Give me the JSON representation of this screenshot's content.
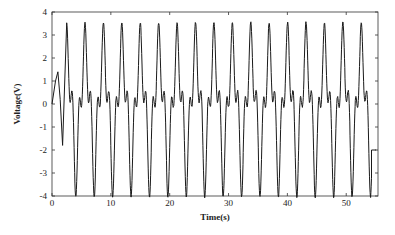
{
  "chart_data": {
    "type": "line",
    "title": "",
    "xlabel": "Time(s)",
    "ylabel": "Voltage(V)",
    "xlim": [
      0,
      55.4
    ],
    "ylim": [
      -4,
      4
    ],
    "xticks": [
      0,
      10,
      20,
      30,
      40,
      50
    ],
    "yticks": [
      -4,
      -3,
      -2,
      -1,
      0,
      1,
      2,
      3,
      4
    ],
    "grid": false,
    "legend": null,
    "series": [
      {
        "name": "Voltage",
        "color": "#1a1a1a",
        "description": "Periodic oscillation with main period ~3.13 s; main peaks ~+3.5 V, main troughs ~-3.7 V, secondary peaks ~+1.7 V, secondary troughs ~-1.8 V; 17 main peaks between t=2.5 s and t=53 s",
        "period_s": 3.13,
        "first_main_peak_s": 2.5,
        "main_peak_v": 3.5,
        "main_trough_v": -3.7,
        "secondary_peak_v": 1.7,
        "secondary_trough_v": -1.8,
        "end_time_s": 54.3,
        "x": [
          0,
          0.6,
          1.0,
          1.4,
          1.8,
          2.5,
          3.3,
          3.9,
          4.4,
          5.0,
          5.6,
          6.2,
          6.9,
          7.5,
          8.1,
          8.7,
          9.3,
          10.0,
          10.8,
          11.3,
          11.9,
          12.5,
          13.1,
          13.8
        ],
        "y": [
          0.0,
          1.0,
          1.4,
          0.2,
          -1.8,
          3.5,
          -1.2,
          1.7,
          -3.7,
          0.8,
          3.5,
          -1.2,
          1.7,
          -3.7,
          0.8,
          3.5,
          -1.2,
          1.7,
          -3.7,
          0.8,
          3.5,
          -1.2,
          1.7,
          -3.7
        ]
      }
    ]
  }
}
